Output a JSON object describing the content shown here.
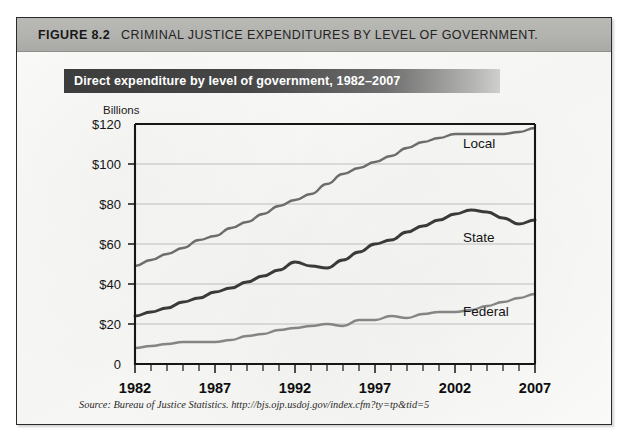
{
  "figure": {
    "number": "FIGURE 8.2",
    "caption": "CRIMINAL JUSTICE EXPENDITURES BY LEVEL OF GOVERNMENT.",
    "source_note": "Source: Bureau of Justice Statistics. http://bjs.ojp.usdoj.gov/index.cfm?ty=tp&tid=5",
    "axis_unit_label": "Billions",
    "colors": {
      "header_band": "#b2b2af",
      "title_bar_dark": "#3d3d3d",
      "title_text": "#ffffff",
      "page_background": "#fafaf8",
      "border": "#2a2a2a",
      "gridline": "#b9b9b9",
      "axis": "#161616",
      "series_local": "#6d6d6d",
      "series_state": "#3a3a3a",
      "series_federal": "#858585"
    }
  },
  "chart_data": {
    "type": "line",
    "title": "Direct expenditure by level of government, 1982–2007",
    "xlabel": "",
    "ylabel": "Billions",
    "ylim": [
      0,
      120
    ],
    "xlim": [
      1982,
      2007
    ],
    "grid": true,
    "legend_position": "inline-right",
    "ytick_labels": [
      "$120",
      "$100",
      "$80",
      "$60",
      "$40",
      "$20",
      "0"
    ],
    "ytick_values": [
      120,
      100,
      80,
      60,
      40,
      20,
      0
    ],
    "xtick_labels": [
      "1982",
      "1987",
      "1992",
      "1997",
      "2002",
      "2007"
    ],
    "xtick_values": [
      1982,
      1987,
      1992,
      1997,
      2002,
      2007
    ],
    "x": [
      1982,
      1983,
      1984,
      1985,
      1986,
      1987,
      1988,
      1989,
      1990,
      1991,
      1992,
      1993,
      1994,
      1995,
      1996,
      1997,
      1998,
      1999,
      2000,
      2001,
      2002,
      2003,
      2004,
      2005,
      2006,
      2007
    ],
    "series": [
      {
        "name": "Local",
        "color": "#6d6d6d",
        "values": [
          49,
          52,
          55,
          58,
          62,
          64,
          68,
          71,
          75,
          79,
          82,
          85,
          90,
          95,
          98,
          101,
          104,
          108,
          111,
          113,
          115,
          115,
          115,
          115,
          116,
          118
        ]
      },
      {
        "name": "State",
        "color": "#3a3a3a",
        "values": [
          24,
          26,
          28,
          31,
          33,
          36,
          38,
          41,
          44,
          47,
          51,
          49,
          48,
          52,
          56,
          60,
          62,
          66,
          69,
          72,
          75,
          77,
          76,
          73,
          70,
          72
        ]
      },
      {
        "name": "Federal",
        "color": "#858585",
        "values": [
          8,
          9,
          10,
          11,
          11,
          11,
          12,
          14,
          15,
          17,
          18,
          19,
          20,
          19,
          22,
          22,
          24,
          23,
          25,
          26,
          26,
          27,
          29,
          31,
          33,
          35
        ]
      }
    ]
  }
}
